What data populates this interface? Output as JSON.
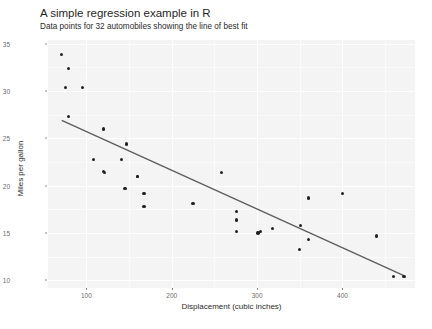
{
  "chart_data": {
    "type": "scatter",
    "title": "A simple regression example in R",
    "subtitle": "Data points for 32 automobiles showing the line of best fit",
    "xlabel": "Displacement (cubic inches)",
    "ylabel": "Miles per gallon",
    "xlim": [
      55,
      485
    ],
    "ylim": [
      9.2,
      35.4
    ],
    "xticks": [
      100,
      200,
      300,
      400
    ],
    "yticks": [
      10,
      15,
      20,
      25,
      30,
      35
    ],
    "grid": true,
    "legend": "none",
    "point_color": "#222222",
    "line_color": "#5e5e5e",
    "panel_color": "#f4f4f4",
    "series": [
      {
        "name": "automobiles",
        "x": [
          160,
          160,
          108,
          258,
          360,
          225,
          360,
          146.7,
          140.8,
          167.6,
          167.6,
          275.8,
          275.8,
          275.8,
          472,
          460,
          440,
          78.7,
          75.7,
          71.1,
          120.1,
          318,
          304,
          350,
          400,
          79,
          120.3,
          95.1,
          351,
          145,
          301,
          121
        ],
        "y": [
          21,
          21,
          22.8,
          21.4,
          18.7,
          18.1,
          14.3,
          24.4,
          22.8,
          19.2,
          17.8,
          16.4,
          17.3,
          15.2,
          10.4,
          10.4,
          14.7,
          32.4,
          30.4,
          33.9,
          21.5,
          15.5,
          15.2,
          13.3,
          19.2,
          27.3,
          26,
          30.4,
          15.8,
          19.7,
          15,
          21.4
        ]
      }
    ],
    "fit_line": {
      "name": "line of best fit",
      "x": [
        71.1,
        472
      ],
      "y": [
        26.9,
        10.5
      ]
    }
  }
}
